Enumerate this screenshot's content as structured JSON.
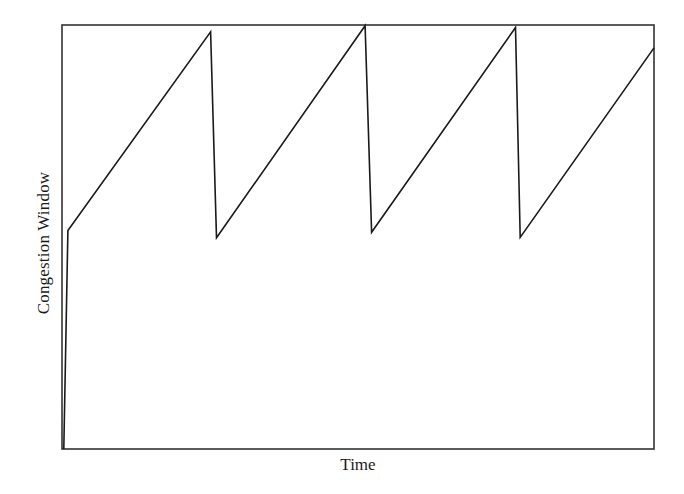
{
  "chart_data": {
    "type": "line",
    "title": "",
    "xlabel": "Time",
    "ylabel": "Congestion Window",
    "grid": false,
    "legend": null,
    "axis_ticks": false,
    "xlim": [
      0,
      100
    ],
    "ylim": [
      0,
      100
    ],
    "series": [
      {
        "name": "cwnd",
        "color": "#1a1a1a",
        "x": [
          0.3,
          1.0,
          25.1,
          26.1,
          51.2,
          52.3,
          76.6,
          77.4,
          100
        ],
        "y": [
          0,
          51.5,
          98.4,
          49.8,
          99.8,
          51.1,
          99.4,
          49.9,
          94.6
        ]
      }
    ],
    "annotations": []
  },
  "plot": {
    "left": 62,
    "top": 25,
    "right": 654,
    "bottom": 449,
    "frame_color": "#333333",
    "line_color": "#1a1a1a"
  }
}
